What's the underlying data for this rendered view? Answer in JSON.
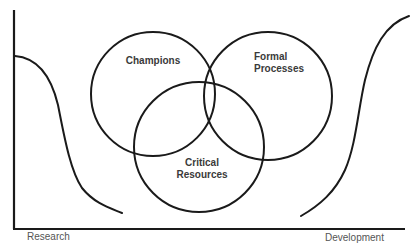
{
  "diagram": {
    "type": "venn-over-valley",
    "circles": [
      {
        "id": "champions",
        "label_lines": [
          "Champions"
        ]
      },
      {
        "id": "formal-processes",
        "label_lines": [
          "Formal",
          "Processes"
        ]
      },
      {
        "id": "critical-resources",
        "label_lines": [
          "Critical",
          "Resources"
        ]
      }
    ],
    "axis": {
      "x_left_label": "Research",
      "x_right_label": "Development"
    },
    "colors": {
      "line": "#1a1a1a",
      "text": "#3a3a3a",
      "background": "#ffffff"
    }
  }
}
